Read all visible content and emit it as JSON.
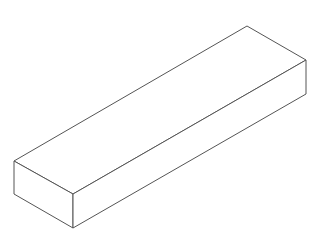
{
  "diagram": {
    "type": "isometric-box",
    "stroke_color": "#555555",
    "fill_color": "#ffffff",
    "background": "#ffffff",
    "vertices": {
      "top_back": [
        247,
        26
      ],
      "right_top": [
        306,
        60
      ],
      "right_bottom": [
        306,
        94
      ],
      "left_top": [
        14,
        161
      ],
      "front_top": [
        73,
        194
      ],
      "front_bottom": [
        73,
        228
      ],
      "left_bottom": [
        14,
        194
      ]
    }
  }
}
